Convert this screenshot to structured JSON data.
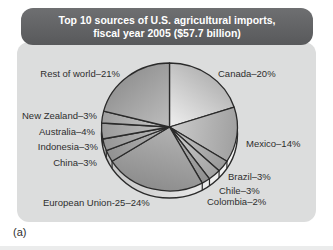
{
  "figure": {
    "header": {
      "title_line1": "Top 10 sources of U.S. agricultural imports,",
      "title_line2": "fiscal year 2005 ($57.7 billion)"
    },
    "caption": "(a)",
    "colors": {
      "header_bg": "#5e5f61",
      "header_text": "#ffffff",
      "panel_bg": "#dcdddd",
      "outline": "#2a2a2a",
      "label_text": "#2e2e2e",
      "rim_dark": "#c2c2c2",
      "rim_light": "#f7f7f7"
    }
  },
  "chart_data": {
    "type": "pie",
    "title": "Top 10 sources of U.S. agricultural imports, fiscal year 2005 ($57.7 billion)",
    "total_label": "$57.7 billion",
    "units": "percent",
    "start": "12 o'clock",
    "direction": "clockwise",
    "style": "3d-grayscale",
    "slices": [
      {
        "name": "Canada",
        "value": 20,
        "label": "Canada–20%",
        "shade_light": "#f0f0f0",
        "shade_dark": "#b5b5b5"
      },
      {
        "name": "Mexico",
        "value": 14,
        "label": "Mexico–14%",
        "shade_light": "#cccccc",
        "shade_dark": "#a0a0a0"
      },
      {
        "name": "Brazil",
        "value": 3,
        "label": "Brazil–3%",
        "shade_light": "#c6c6c6",
        "shade_dark": "#999999"
      },
      {
        "name": "Chile",
        "value": 3,
        "label": "Chile–3%",
        "shade_light": "#cfcfcf",
        "shade_dark": "#a2a2a2"
      },
      {
        "name": "Colombia",
        "value": 2,
        "label": "Colombia–2%",
        "shade_light": "#b8b8b8",
        "shade_dark": "#8f8f8f"
      },
      {
        "name": "European Union-25",
        "value": 24,
        "label": "European Union-25–24%",
        "shade_light": "#b2b2b2",
        "shade_dark": "#8d8d8d"
      },
      {
        "name": "China",
        "value": 3,
        "label": "China–3%",
        "shade_light": "#b6b6b6",
        "shade_dark": "#919191"
      },
      {
        "name": "Indonesia",
        "value": 3,
        "label": "Indonesia–3%",
        "shade_light": "#bcbcbc",
        "shade_dark": "#969696"
      },
      {
        "name": "Australia",
        "value": 4,
        "label": "Australia–4%",
        "shade_light": "#c2c2c2",
        "shade_dark": "#9a9a9a"
      },
      {
        "name": "New Zealand",
        "value": 3,
        "label": "New Zealand–3%",
        "shade_light": "#c9c9c9",
        "shade_dark": "#9e9e9e"
      },
      {
        "name": "Rest of world",
        "value": 21,
        "label": "Rest of world–21%",
        "shade_light": "#bdbdbd",
        "shade_dark": "#949494"
      }
    ]
  }
}
